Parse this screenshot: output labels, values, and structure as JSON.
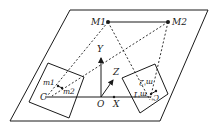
{
  "diagram": {
    "type": "stereo-camera-geometry",
    "colors": {
      "stroke": "#1a1a1a",
      "background": "#ffffff"
    },
    "points": {
      "M1": {
        "label": "M1",
        "x": 108,
        "y": 22
      },
      "M2": {
        "label": "M2",
        "x": 168,
        "y": 22
      },
      "O": {
        "label": "O",
        "x": 101,
        "y": 100
      },
      "C": {
        "label": "C",
        "x": 45,
        "y": 96
      },
      "C_prime": {
        "label": "C'",
        "x": 150,
        "y": 100
      },
      "m1": {
        "label": "m1",
        "x": 58,
        "y": 85
      },
      "m2": {
        "label": "m2",
        "x": 62,
        "y": 88
      },
      "m1_prime": {
        "label": "m'1",
        "x": 153,
        "y": 94
      },
      "m2_prime": {
        "label": "m'2",
        "x": 158,
        "y": 89
      }
    },
    "axes": {
      "X": {
        "label": "X"
      },
      "Y": {
        "label": "Y"
      },
      "Z": {
        "label": "Z"
      }
    },
    "labels": {
      "M1": "M1",
      "M2": "M2",
      "Y": "Y",
      "Z": "Z",
      "O": "O",
      "X": "X",
      "C": "C",
      "C_prime": "C'",
      "m1": "m1",
      "m2": "m2",
      "m1_prime": "m'1",
      "m2_prime": "m'2"
    },
    "elements": [
      "ground-plane-parallelogram",
      "left-image-plane",
      "right-image-plane",
      "baseline-M1-M2",
      "projection-rays-dashed",
      "world-axes"
    ]
  }
}
